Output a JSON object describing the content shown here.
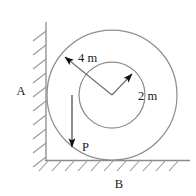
{
  "figure": {
    "type": "engineering-free-body-diagram",
    "line_color": "#8a8a8a",
    "accent_color": "#111111",
    "text_color": "#1a1a1a"
  },
  "labels": {
    "outer_radius": "4 m",
    "inner_radius": "2 m",
    "wall_contact": "A",
    "ground_contact": "B",
    "force": "P"
  },
  "geometry": {
    "center": {
      "x": 112,
      "y": 95
    },
    "outer_circle_radius": 65,
    "inner_circle_radius": 33,
    "wall_x": 46,
    "ground_y": 160,
    "force_line_x": 72,
    "force_arrow_tip_y": 150,
    "outer_radius_arrow_tip": {
      "x": 63,
      "y": 55
    },
    "inner_radius_arrow_tip": {
      "x": 134,
      "y": 72
    }
  }
}
